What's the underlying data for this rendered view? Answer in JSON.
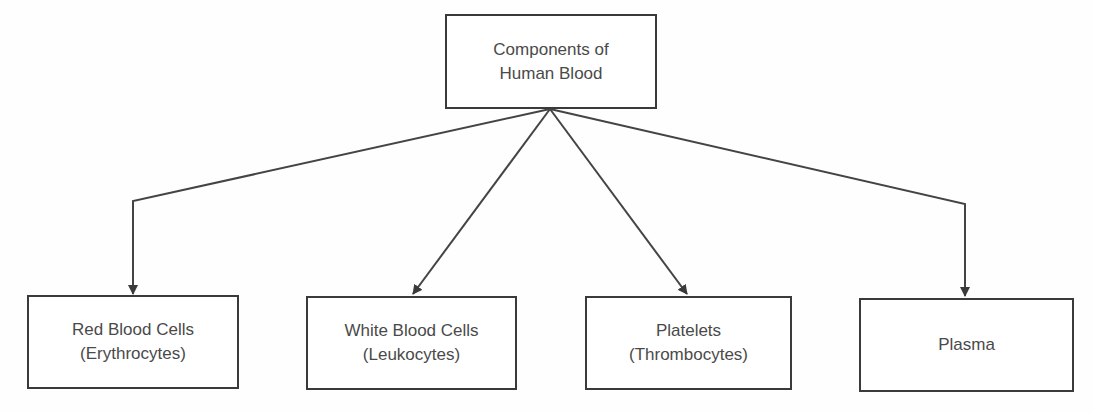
{
  "diagram": {
    "type": "tree",
    "root": {
      "id": "root",
      "lines": [
        "Components of",
        "Human Blood"
      ]
    },
    "children": [
      {
        "id": "rbc",
        "lines": [
          "Red Blood Cells",
          "(Erythrocytes)"
        ]
      },
      {
        "id": "wbc",
        "lines": [
          "White Blood Cells",
          "(Leukocytes)"
        ]
      },
      {
        "id": "platelets",
        "lines": [
          "Platelets",
          "(Thrombocytes)"
        ]
      },
      {
        "id": "plasma",
        "lines": [
          "Plasma"
        ]
      }
    ],
    "edges": [
      {
        "from": "root",
        "to": "rbc",
        "style": "elbow-arrow"
      },
      {
        "from": "root",
        "to": "wbc",
        "style": "straight-arrow"
      },
      {
        "from": "root",
        "to": "platelets",
        "style": "straight-arrow"
      },
      {
        "from": "root",
        "to": "plasma",
        "style": "elbow-arrow"
      }
    ],
    "colors": {
      "border": "#3a3a3a",
      "text": "#4a4a4a",
      "edge": "#444444",
      "background": "#ffffff"
    }
  }
}
